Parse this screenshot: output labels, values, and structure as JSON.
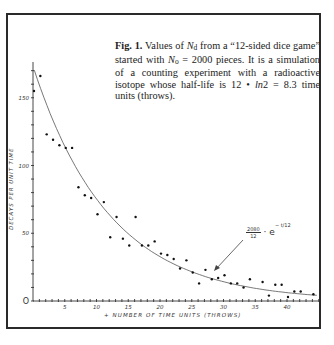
{
  "caption": {
    "fig_label": "Fig. 1.",
    "text_1": " Values of ",
    "symbol_nd": "N",
    "symbol_nd_sub": "d",
    "text_2": " from a “12-sided dice game” started with ",
    "symbol_no": "N",
    "symbol_no_sub": "o",
    "text_3": " = 2000 pieces. It is a simulation of a counting experiment with a radioactive isotope whose half-life is 12 • ",
    "symbol_ln": "ln",
    "text_4": "2 = 8.3 time units (throws)."
  },
  "axes": {
    "ylabel": "DECAYS PER UNIT TIME",
    "xlabel": "+ NUMBER OF TIME UNITS (THROWS)",
    "y_ticks": [
      "0",
      "50",
      "100",
      "150"
    ],
    "x_ticks": [
      "5",
      "10",
      "15",
      "20",
      "25",
      "30",
      "35",
      "40"
    ]
  },
  "formula": {
    "numerator": "2080",
    "denominator": "12",
    "base": "· e",
    "exponent": "− t/12"
  },
  "chart_data": {
    "type": "scatter",
    "xlabel": "Number of time units (throws)",
    "ylabel": "Decays per unit time",
    "xlim": [
      0,
      45
    ],
    "ylim": [
      0,
      175
    ],
    "x_ticks": [
      5,
      10,
      15,
      20,
      25,
      30,
      35,
      40
    ],
    "y_ticks": [
      0,
      50,
      100,
      150
    ],
    "grid": false,
    "legend": null,
    "series": [
      {
        "name": "Observed decays",
        "type": "scatter",
        "x": [
          0,
          1,
          2,
          3,
          4,
          5,
          6,
          7,
          8,
          9,
          10,
          11,
          12,
          13,
          14,
          15,
          16,
          17,
          18,
          19,
          20,
          21,
          22,
          23,
          24,
          25,
          26,
          27,
          28,
          29,
          30,
          31,
          32,
          33,
          34,
          36,
          37,
          38,
          39,
          40,
          41,
          42,
          44
        ],
        "y": [
          155,
          166,
          123,
          119,
          115,
          113,
          113,
          84,
          78,
          76,
          64,
          73,
          47,
          62,
          46,
          41,
          62,
          41,
          41,
          44,
          35,
          34,
          31,
          24,
          30,
          21,
          13,
          23,
          16,
          17,
          19,
          13,
          13,
          10,
          16,
          14,
          4,
          12,
          12,
          3,
          7,
          7,
          5
        ]
      },
      {
        "name": "Fit: 2080/12 · e^(−t/12)",
        "type": "line",
        "function": "173.3 * exp(-t/12)",
        "x": [
          0,
          5,
          10,
          15,
          20,
          25,
          30,
          35,
          40,
          45
        ],
        "y": [
          173.3,
          114.0,
          75.3,
          49.7,
          32.8,
          21.6,
          14.2,
          9.4,
          6.2,
          4.1
        ]
      }
    ],
    "annotations": [
      {
        "text": "2080/12 · e^(−t/12)",
        "arrow_to": {
          "x": 28,
          "y": 22
        }
      }
    ]
  }
}
